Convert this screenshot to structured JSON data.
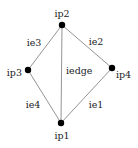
{
  "nodes": [
    {
      "id": "ip1",
      "label": "ip1"
    },
    {
      "id": "ip2",
      "label": "ip2"
    },
    {
      "id": "ip3",
      "label": "ip3"
    },
    {
      "id": "ip4",
      "label": "ip4"
    }
  ],
  "edges": [
    {
      "id": "ie1",
      "label": "ie1",
      "from": "ip1",
      "to": "ip4"
    },
    {
      "id": "ie2",
      "label": "ie2",
      "from": "ip2",
      "to": "ip4"
    },
    {
      "id": "ie3",
      "label": "ie3",
      "from": "ip2",
      "to": "ip3"
    },
    {
      "id": "ie4",
      "label": "ie4",
      "from": "ip3",
      "to": "ip1"
    },
    {
      "id": "iedge",
      "label": "iedge",
      "from": "ip1",
      "to": "ip2"
    }
  ]
}
